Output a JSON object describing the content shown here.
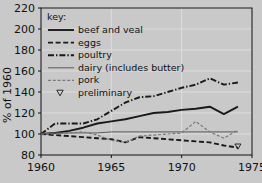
{
  "chart_data": {
    "type": "line",
    "title": "",
    "xlabel": "",
    "ylabel": "% of 1960",
    "xlim": [
      1960,
      1975
    ],
    "ylim": [
      80,
      220
    ],
    "yticks": [
      80,
      100,
      120,
      140,
      160,
      180,
      200,
      220
    ],
    "xticks": [
      1960,
      1965,
      1970,
      1975
    ],
    "xticklabels": [
      "1960",
      "1965",
      "1970",
      "1975"
    ],
    "yticklabels": [
      "80",
      "100",
      "120",
      "140",
      "160",
      "180",
      "200",
      "220"
    ],
    "grid": true,
    "legend_position": "upper-left-inside",
    "legend_title": "key:",
    "x": [
      1960,
      1961,
      1962,
      1963,
      1964,
      1965,
      1966,
      1967,
      1968,
      1969,
      1970,
      1971,
      1972,
      1973,
      1974
    ],
    "series": [
      {
        "name": "beef and veal",
        "style": "solid",
        "color": "#1a1a1a",
        "values": [
          100,
          101,
          103,
          106,
          110,
          112,
          114,
          117,
          120,
          121,
          123,
          124,
          126,
          119,
          126
        ]
      },
      {
        "name": "eggs",
        "style": "dashed",
        "color": "#1a1a1a",
        "values": [
          100,
          99,
          98,
          97,
          96,
          95,
          92,
          97,
          96,
          95,
          94,
          93,
          92,
          89,
          87
        ]
      },
      {
        "name": "poultry",
        "style": "dash-dot",
        "color": "#1a1a1a",
        "values": [
          100,
          110,
          110,
          110,
          114,
          122,
          130,
          135,
          136,
          140,
          144,
          147,
          153,
          147,
          149
        ]
      },
      {
        "name": "dairy (includes butter)",
        "style": "thin-solid",
        "color": "#5a5a5a",
        "values": [
          100,
          101,
          101,
          101,
          101,
          102,
          102,
          102,
          102,
          102,
          102,
          102,
          102,
          102,
          102
        ]
      },
      {
        "name": "pork",
        "style": "thin-dashed",
        "color": "#7a7a7a",
        "values": [
          100,
          100,
          101,
          102,
          99,
          94,
          92,
          98,
          99,
          100,
          101,
          112,
          102,
          96,
          104
        ]
      }
    ],
    "marker_note": {
      "name": "preliminary",
      "marker": "open-triangle-down",
      "x": 1974,
      "y": 88
    }
  },
  "legend": {
    "title": "key:",
    "items": [
      {
        "label": "beef and veal",
        "sample": "solid"
      },
      {
        "label": "eggs",
        "sample": "dashed"
      },
      {
        "label": "poultry",
        "sample": "dash-dot"
      },
      {
        "label": "dairy (includes butter)",
        "sample": "thin-solid"
      },
      {
        "label": "pork",
        "sample": "thin-dashed"
      },
      {
        "label": "preliminary",
        "sample": "open-triangle-down"
      }
    ]
  },
  "colors": {
    "background": "#c9c9c9",
    "plot_background": "#c6c6c6",
    "axis": "#111111",
    "grid": "#dcdcdc",
    "ink": "#1a1a1a",
    "muted": "#6e6e6e"
  }
}
